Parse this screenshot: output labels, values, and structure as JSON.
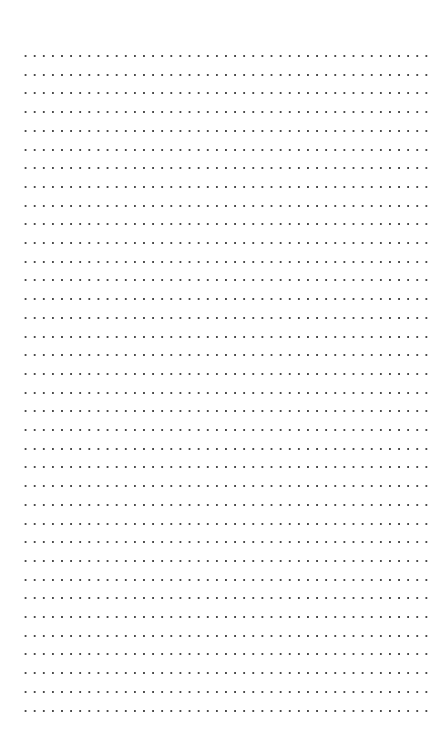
{
  "page": {
    "type": "dotted-ruled-paper",
    "background_color": "#ffffff",
    "dot_color": "#4a4a4a"
  },
  "grid": {
    "rows": 36,
    "columns": 45,
    "first_row_y": 56,
    "row_spacing": 18.7,
    "first_col_x": 22,
    "col_spacing": 9.12
  }
}
